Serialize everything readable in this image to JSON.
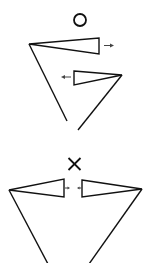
{
  "diagram": {
    "panels": [
      {
        "id": "correct",
        "mark": "O",
        "mark_meaning": "correct",
        "elements": [
          "upper-wedge with arrow pointing right",
          "lower-wedge with arrow pointing left",
          "two converging long lines"
        ]
      },
      {
        "id": "incorrect",
        "mark": "×",
        "mark_meaning": "incorrect",
        "elements": [
          "left-wedge with arrow pointing right (inward)",
          "right-wedge with arrow pointing left (inward)",
          "two converging long lines"
        ]
      }
    ],
    "colors": {
      "line": "#111111",
      "arrow": "#444444",
      "background": "#ffffff"
    }
  }
}
